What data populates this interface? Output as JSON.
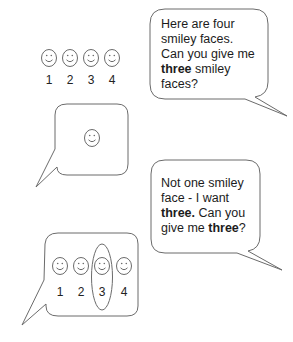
{
  "top_row": {
    "smiley_count": 4,
    "numbers": [
      "1",
      "2",
      "3",
      "4"
    ]
  },
  "bubble_1": {
    "lines": [
      {
        "parts": [
          {
            "text": "Here are four",
            "bold": false
          }
        ]
      },
      {
        "parts": [
          {
            "text": "smiley faces.",
            "bold": false
          }
        ]
      },
      {
        "parts": [
          {
            "text": "Can you give me",
            "bold": false
          }
        ]
      },
      {
        "parts": [
          {
            "text": "three",
            "bold": true
          },
          {
            "text": " smiley",
            "bold": false
          }
        ]
      },
      {
        "parts": [
          {
            "text": "faces?",
            "bold": false
          }
        ]
      }
    ],
    "line1": "Here are four",
    "line2": "smiley faces.",
    "line3": "Can you give me",
    "line4_bold": "three",
    "line4_rest": " smiley",
    "line5": "faces?"
  },
  "bubble_2": {
    "smiley_count": 1
  },
  "bubble_3": {
    "line1": "Not one smiley",
    "line2": "face - I want",
    "line3_bold": "three.",
    "line3_rest": " Can you",
    "line4_pre": "give me ",
    "line4_bold": "three",
    "line4_post": "?"
  },
  "bubble_4": {
    "smiley_count": 4,
    "numbers": [
      "1",
      "2",
      "3",
      "4"
    ],
    "circled_index": 3
  },
  "colors": {
    "stroke": "#6b6b6b",
    "text": "#1c1c1c",
    "background": "#ffffff"
  }
}
